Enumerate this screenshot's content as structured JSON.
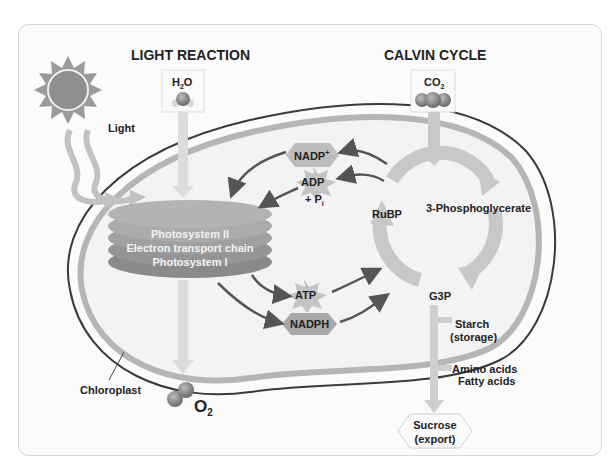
{
  "diagram": {
    "sections": {
      "light_reaction_title": "LIGHT REACTION",
      "calvin_cycle_title": "CALVIN CYCLE"
    },
    "inputs": {
      "light": "Light",
      "water": "H",
      "water_sub": "2",
      "water_tail": "O",
      "co2": "CO",
      "co2_sub": "2"
    },
    "outputs": {
      "oxygen": "O",
      "oxygen_sub": "2"
    },
    "thylakoid": {
      "line1": "Photosystem II",
      "line2": "Electron transport chain",
      "line3": "Photosystem I"
    },
    "molecules": {
      "nadp": "NADP",
      "nadp_sup": "+",
      "adp": "ADP",
      "pi": "+ P",
      "pi_sub": "i",
      "atp": "ATP",
      "nadph": "NADPH"
    },
    "calvin": {
      "rubp": "RuBP",
      "pga": "3-Phosphoglycerate",
      "g3p": "G3P"
    },
    "products": {
      "starch_line1": "Starch",
      "starch_line2": "(storage)",
      "amino": "Amino acids",
      "fatty": "Fatty acids",
      "sucrose_line1": "Sucrose",
      "sucrose_line2": "(export)"
    },
    "organelle_label": "Chloroplast",
    "colors": {
      "outline": "#3a3a3a",
      "membrane": "#b5b5b5",
      "stroma": "#f3f3f3",
      "arrow_light": "#cfcfcf",
      "arrow_dark": "#4a4a4a",
      "thylakoid": "#9a9a9a",
      "text": "#222222"
    }
  }
}
